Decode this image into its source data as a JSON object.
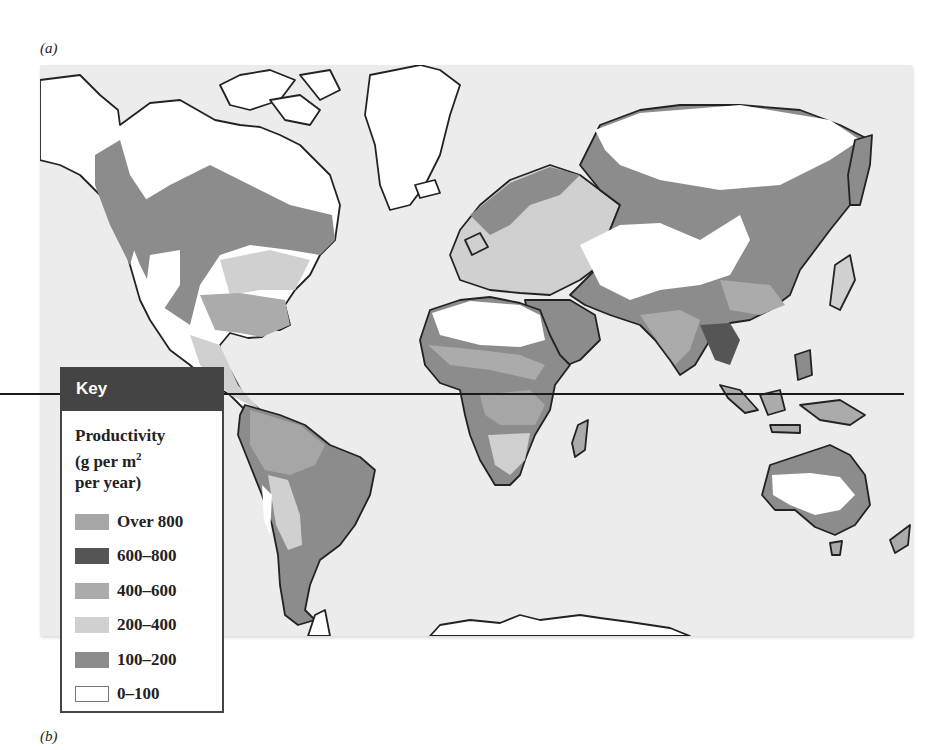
{
  "figure": {
    "panel_a_label": "(a)",
    "panel_b_label": "(b)"
  },
  "key": {
    "header": "Key",
    "title_line1": "Productivity",
    "title_line2_prefix": "(g per m",
    "title_line2_sup": "2",
    "title_line3": "per year)",
    "items": [
      {
        "label": "Over 800",
        "color": "#a6a6a6"
      },
      {
        "label": "600–800",
        "color": "#555555"
      },
      {
        "label": "400–600",
        "color": "#ababab"
      },
      {
        "label": "200–400",
        "color": "#d0d0d0"
      },
      {
        "label": "100–200",
        "color": "#8c8c8c"
      },
      {
        "label": "0–100",
        "color": "#ffffff"
      }
    ]
  },
  "map": {
    "ocean_color": "#ececec",
    "coastline_color": "#222222",
    "equator_shown": true,
    "regions": [
      {
        "name": "North America",
        "dominant_classes": [
          "100–200",
          "400–600",
          "200–400",
          "0–100"
        ]
      },
      {
        "name": "South America",
        "dominant_classes": [
          "Over 800",
          "100–200",
          "200–400"
        ]
      },
      {
        "name": "Europe",
        "dominant_classes": [
          "200–400",
          "100–200"
        ]
      },
      {
        "name": "Africa",
        "dominant_classes": [
          "0–100",
          "Over 800",
          "100–200",
          "200–400"
        ]
      },
      {
        "name": "Asia",
        "dominant_classes": [
          "0–100",
          "100–200",
          "400–600",
          "600–800"
        ]
      },
      {
        "name": "Australia",
        "dominant_classes": [
          "0–100",
          "100–200",
          "400–600"
        ]
      },
      {
        "name": "Greenland & Arctic",
        "dominant_classes": [
          "0–100"
        ]
      },
      {
        "name": "Antarctica",
        "dominant_classes": [
          "0–100"
        ]
      }
    ]
  }
}
